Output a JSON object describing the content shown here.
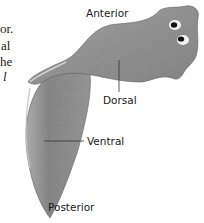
{
  "figure": {
    "labels": {
      "anterior": "Anterior",
      "dorsal": "Dorsal",
      "ventral": "Ventral",
      "posterior": "Posterior"
    }
  },
  "body_text_fragments": [
    {
      "text": "or.",
      "italic": false
    },
    {
      "text": "al",
      "italic": false
    },
    {
      "text": "he",
      "italic": false
    },
    {
      "text": "l",
      "italic": true
    }
  ],
  "colors": {
    "body_fill": "#8a8a8a",
    "body_light": "#b5b5b5",
    "body_dark": "#6a6a6a",
    "eye_white": "#f2f2f2",
    "eye_pupil": "#111111",
    "label_text": "#1a1a1a",
    "leader_line": "#333333"
  }
}
